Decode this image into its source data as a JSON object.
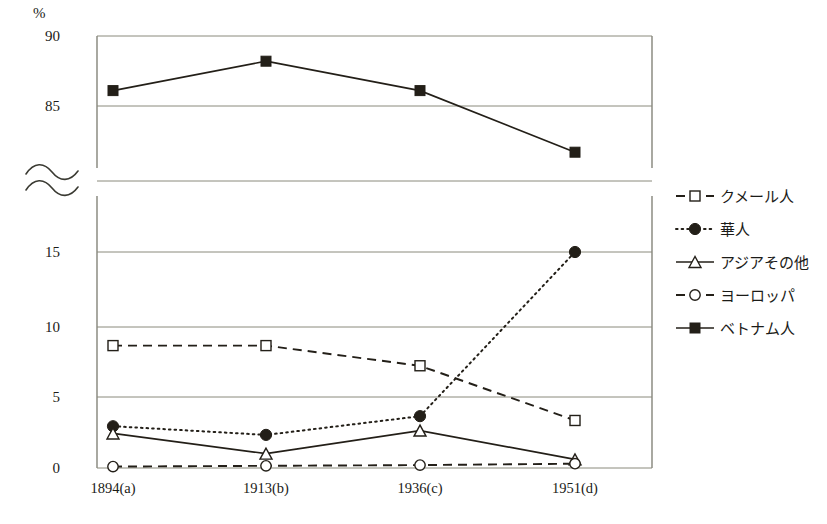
{
  "chart_data": {
    "type": "line",
    "title": "",
    "xlabel": "",
    "ylabel": "",
    "unit_label": "%",
    "categories": [
      "1894(a)",
      "1913(b)",
      "1936(c)",
      "1951(d)"
    ],
    "grid": true,
    "legend_position": "right",
    "axis_break": true,
    "lower_panel": {
      "ylim": [
        0,
        17.5
      ],
      "ticks": [
        0,
        5,
        10,
        15
      ]
    },
    "upper_panel": {
      "ylim": [
        80.5,
        90
      ],
      "ticks": [
        85,
        90
      ]
    },
    "series": [
      {
        "name": "クメール人",
        "marker": "open-square",
        "line_style": "dashed",
        "values": [
          8.5,
          8.5,
          7.1,
          3.3
        ]
      },
      {
        "name": "華人",
        "marker": "filled-circle",
        "line_style": "dotted",
        "values": [
          2.9,
          2.3,
          3.6,
          15.0
        ]
      },
      {
        "name": "アジアその他",
        "marker": "open-triangle",
        "line_style": "solid",
        "values": [
          2.4,
          1.0,
          2.6,
          0.6
        ]
      },
      {
        "name": "ヨーロッパ",
        "marker": "open-circle",
        "line_style": "dashed",
        "values": [
          0.1,
          0.15,
          0.2,
          0.3
        ]
      },
      {
        "name": "ベトナム人",
        "marker": "filled-square",
        "line_style": "solid",
        "values": [
          86.1,
          88.2,
          86.1,
          81.7
        ]
      }
    ],
    "colors": {
      "ink": "#231f18",
      "grid": "#8a8a7d",
      "frame": "#6f6f63",
      "background": "#ffffff"
    }
  },
  "axis": {
    "unit": "%",
    "y_ticks_upper": [
      "90",
      "85"
    ],
    "y_ticks_lower": [
      "15",
      "10",
      "5",
      "0"
    ],
    "x_ticks": [
      "1894(a)",
      "1913(b)",
      "1936(c)",
      "1951(d)"
    ]
  },
  "legend": {
    "items": [
      {
        "label": "クメール人",
        "marker": "open-square-icon",
        "style": "dashed"
      },
      {
        "label": "華人",
        "marker": "filled-circle-icon",
        "style": "dotted"
      },
      {
        "label": "アジアその他",
        "marker": "open-triangle-icon",
        "style": "solid"
      },
      {
        "label": "ヨーロッパ",
        "marker": "open-circle-icon",
        "style": "dashed"
      },
      {
        "label": "ベトナム人",
        "marker": "filled-square-icon",
        "style": "solid"
      }
    ]
  },
  "caption": {
    "text": ""
  }
}
